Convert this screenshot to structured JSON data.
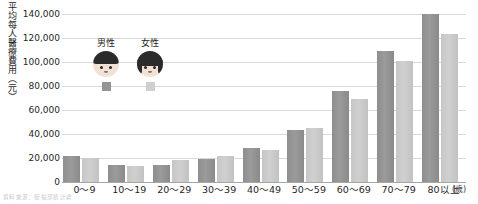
{
  "chart_data": {
    "type": "bar",
    "title": "",
    "ylabel": "平均每人醫療費用（元）",
    "xlabel": "",
    "xunit": "(歲)",
    "ylim": [
      0,
      140000
    ],
    "yticks": [
      "140,000",
      "120,000",
      "100,000",
      "80,000",
      "60,000",
      "40,000",
      "20,000",
      "0"
    ],
    "ytick_values": [
      140000,
      120000,
      100000,
      80000,
      60000,
      40000,
      20000,
      0
    ],
    "grid": true,
    "legend_position": "inside-top-left",
    "categories": [
      "0～9",
      "10～19",
      "20～29",
      "30～39",
      "40～49",
      "50～59",
      "60～69",
      "70～79",
      "80以上"
    ],
    "series": [
      {
        "name": "男性",
        "color": "#949494",
        "values": [
          22000,
          14000,
          14500,
          19000,
          28500,
          43000,
          76000,
          109000,
          140000
        ]
      },
      {
        "name": "女性",
        "color": "#cfcfcf",
        "values": [
          20000,
          13500,
          18000,
          22000,
          27000,
          45000,
          69000,
          101000,
          123000
        ]
      }
    ]
  },
  "legend": {
    "male": {
      "label": "男性",
      "icon": "male-face-icon",
      "swatch": "#949494"
    },
    "female": {
      "label": "女性",
      "icon": "female-face-icon",
      "swatch": "#cfcfcf"
    }
  },
  "source_note": "資料來源：衛福部統計處"
}
